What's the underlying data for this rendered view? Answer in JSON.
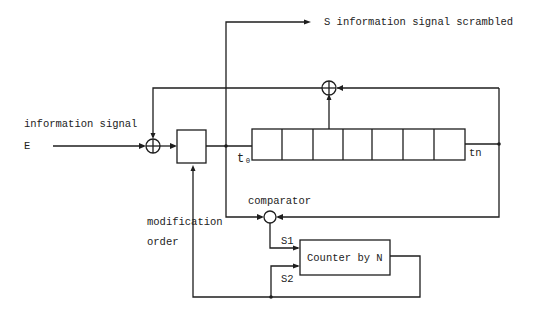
{
  "diagram": {
    "title": "",
    "labels": {
      "input_label": "information signal",
      "input_symbol": "E",
      "output_label": "S information signal scrambled",
      "register_start": "t₀",
      "register_end": "tn",
      "comparator": "comparator",
      "modification_line1": "modification",
      "modification_line2": "order",
      "s1": "S1",
      "s2": "S2",
      "counter": "Counter by N"
    },
    "nodes": [
      {
        "id": "xor-input",
        "type": "xor",
        "label": ""
      },
      {
        "id": "modifier-block",
        "type": "box",
        "label": ""
      },
      {
        "id": "shift-register",
        "type": "register",
        "cells": 7,
        "start": "t₀",
        "end": "tn"
      },
      {
        "id": "xor-feedback",
        "type": "xor",
        "label": ""
      },
      {
        "id": "comparator",
        "type": "comparator",
        "label": "comparator"
      },
      {
        "id": "counter",
        "type": "box",
        "label": "Counter by N"
      }
    ],
    "edges": [
      {
        "from": "E",
        "to": "xor-input"
      },
      {
        "from": "xor-input",
        "to": "modifier-block"
      },
      {
        "from": "modifier-block",
        "to": "shift-register",
        "label": "t₀"
      },
      {
        "from": "modifier-block",
        "to": "S",
        "label": "S information signal scrambled"
      },
      {
        "from": "shift-register",
        "to": "xor-feedback"
      },
      {
        "from": "shift-register",
        "to": "xor-feedback",
        "label": "tn"
      },
      {
        "from": "xor-feedback",
        "to": "xor-input"
      },
      {
        "from": "modifier-block",
        "to": "comparator"
      },
      {
        "from": "shift-register",
        "to": "comparator",
        "label": "tn"
      },
      {
        "from": "comparator",
        "to": "counter",
        "label": "S1"
      },
      {
        "from": "counter",
        "to": "counter",
        "label": "S2"
      },
      {
        "from": "counter",
        "to": "modifier-block",
        "label": "modification order"
      }
    ]
  }
}
